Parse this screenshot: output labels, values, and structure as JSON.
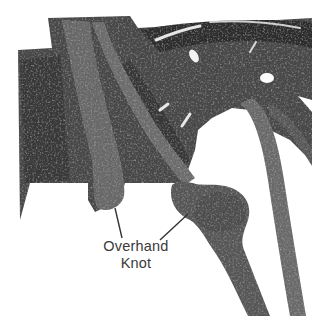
{
  "figure": {
    "style": "grayscale photo illustration",
    "callout": {
      "line1": "Overhand",
      "line2": "Knot",
      "leader_lines": 2
    },
    "colors": {
      "background": "#ffffff",
      "fabric_dark": "#3c3c3c",
      "fabric_mid": "#5e5e5e",
      "cord": "#6a6a6a",
      "highlight": "#d8d8d8",
      "label_text": "#3a3a3a"
    }
  }
}
